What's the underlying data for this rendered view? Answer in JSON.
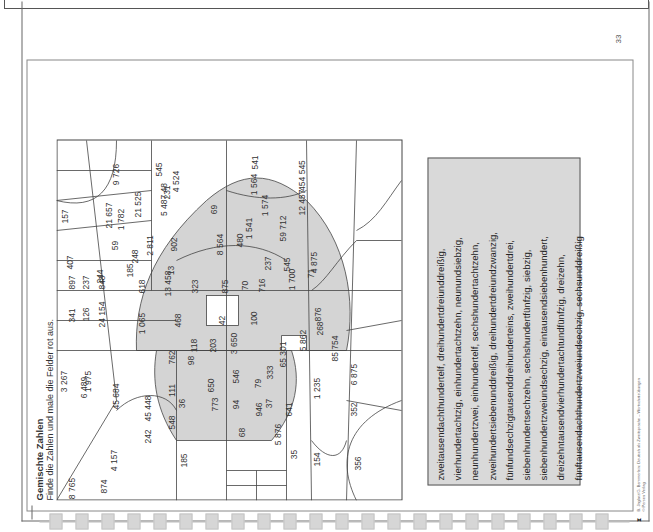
{
  "page": {
    "number": "33",
    "title": "Gemischte Zahlen",
    "instruction": "Finde die Zahlen und male die Felder rot aus.",
    "footer": {
      "line1": "B. Jaglarz/G. Bemmerlein: Deutsch als Zweitsprache – Wortschatzübungen",
      "line2": "© Persen Verlag",
      "logo": "persen-logo"
    }
  },
  "grid": {
    "colors": {
      "shaded": "#d4d4d4",
      "line": "#444444",
      "background": "#ffffff"
    },
    "cells": [
      {
        "label": "8 765",
        "shaded": false
      },
      {
        "label": "874",
        "shaded": false
      },
      {
        "label": "4 157",
        "shaded": false
      },
      {
        "label": "185",
        "shaded": false
      },
      {
        "label": "242",
        "shaded": false
      },
      {
        "label": "548",
        "shaded": false
      },
      {
        "label": "3 267",
        "shaded": false
      },
      {
        "label": "1 975",
        "shaded": false
      },
      {
        "label": "45 684",
        "shaded": false
      },
      {
        "label": "45 448",
        "shaded": false
      },
      {
        "label": "36",
        "shaded": true
      },
      {
        "label": "111",
        "shaded": true
      },
      {
        "label": "98",
        "shaded": false
      },
      {
        "label": "6 489",
        "shaded": false
      },
      {
        "label": "762",
        "shaded": true
      },
      {
        "label": "118",
        "shaded": true
      },
      {
        "label": "203",
        "shaded": true
      },
      {
        "label": "650",
        "shaded": true
      },
      {
        "label": "773",
        "shaded": false
      },
      {
        "label": "68",
        "shaded": false
      },
      {
        "label": "94",
        "shaded": false
      },
      {
        "label": "546",
        "shaded": false
      },
      {
        "label": "946",
        "shaded": false
      },
      {
        "label": "37",
        "shaded": false
      },
      {
        "label": "79",
        "shaded": true
      },
      {
        "label": "333",
        "shaded": true
      },
      {
        "label": "3 650",
        "shaded": false
      },
      {
        "label": "5 876",
        "shaded": false
      },
      {
        "label": "35",
        "shaded": false
      },
      {
        "label": "154",
        "shaded": false
      },
      {
        "label": "356",
        "shaded": false
      },
      {
        "label": "641",
        "shaded": false
      },
      {
        "label": "352",
        "shaded": false
      },
      {
        "label": "1 235",
        "shaded": false
      },
      {
        "label": "6 875",
        "shaded": false
      },
      {
        "label": "65 301",
        "shaded": true
      },
      {
        "label": "5 862",
        "shaded": true
      },
      {
        "label": "85 754",
        "shaded": false
      },
      {
        "label": "341",
        "shaded": false
      },
      {
        "label": "126",
        "shaded": false
      },
      {
        "label": "24 154",
        "shaded": false
      },
      {
        "label": "897",
        "shaded": false
      },
      {
        "label": "237",
        "shaded": false
      },
      {
        "label": "848",
        "shaded": false
      },
      {
        "label": "1 065",
        "shaded": false
      },
      {
        "label": "468",
        "shaded": false
      },
      {
        "label": "42",
        "shaded": false
      },
      {
        "label": "100",
        "shaded": false
      },
      {
        "label": "268",
        "shaded": false
      },
      {
        "label": "876",
        "shaded": false
      },
      {
        "label": "407",
        "shaded": false
      },
      {
        "label": "244",
        "shaded": false
      },
      {
        "label": "185",
        "shaded": false
      },
      {
        "label": "618",
        "shaded": true
      },
      {
        "label": "13 458",
        "shaded": true
      },
      {
        "label": "323",
        "shaded": true
      },
      {
        "label": "13",
        "shaded": true
      },
      {
        "label": "248",
        "shaded": false
      },
      {
        "label": "59",
        "shaded": false
      },
      {
        "label": "2 811",
        "shaded": true
      },
      {
        "label": "902",
        "shaded": true
      },
      {
        "label": "875",
        "shaded": false
      },
      {
        "label": "70",
        "shaded": true
      },
      {
        "label": "716",
        "shaded": true
      },
      {
        "label": "1 700",
        "shaded": true
      },
      {
        "label": "237",
        "shaded": true
      },
      {
        "label": "480",
        "shaded": true
      },
      {
        "label": "8 564",
        "shaded": false
      },
      {
        "label": "545",
        "shaded": false
      },
      {
        "label": "71",
        "shaded": false
      },
      {
        "label": "4 875",
        "shaded": false
      },
      {
        "label": "1 541",
        "shaded": false
      },
      {
        "label": "59 712",
        "shaded": false
      },
      {
        "label": "157",
        "shaded": false
      },
      {
        "label": "21 657",
        "shaded": false
      },
      {
        "label": "1 782",
        "shaded": false
      },
      {
        "label": "21 525",
        "shaded": false
      },
      {
        "label": "5 487 48",
        "shaded": false
      },
      {
        "label": "9 726",
        "shaded": false
      },
      {
        "label": "231",
        "shaded": false
      },
      {
        "label": "545",
        "shaded": false
      },
      {
        "label": "4 524",
        "shaded": false
      },
      {
        "label": "69",
        "shaded": false
      },
      {
        "label": "1 574",
        "shaded": false
      },
      {
        "label": "12 457",
        "shaded": false
      },
      {
        "label": "1 564",
        "shaded": false
      },
      {
        "label": "541",
        "shaded": false
      },
      {
        "label": "454 545",
        "shaded": false
      }
    ]
  },
  "textbox": {
    "lines": [
      "zweitausendachthundertelf, dreihundertdreiunddreißig,",
      "vierhundertachtzig, einhundertachtzehn, neunundsiebzig,",
      "neunhundertzwei, einhundertelf, sechshundertachtzehn,",
      "zweihundertsiebenunddreißig, dreihundertdreiundzwanzig,",
      "fünfundsechzigtausenddreihunderteins, zweihundertdrei,",
      "siebenhundertsechzehn, sechshundertfünfzig, siebzig,",
      "siebenhundertzweiundsechzig, eintausendsiebenhundert,",
      "dreizehntausendvierhundertachtundfünfzig, dreizehn,",
      "fünftausendachthundertzweiundsechzig, sechsunddreißig"
    ]
  }
}
